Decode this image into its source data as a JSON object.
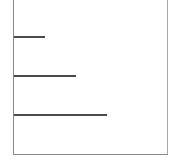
{
  "diagram": {
    "frame": {
      "left": 13,
      "top": 0,
      "width": 155,
      "height": 155,
      "open_side": "top",
      "border_color": "#8a8a8a"
    },
    "lines": [
      {
        "y": 36,
        "x_start": 14,
        "x_end": 45,
        "color": "#4a4a4a"
      },
      {
        "y": 75,
        "x_start": 14,
        "x_end": 76,
        "color": "#4a4a4a"
      },
      {
        "y": 114,
        "x_start": 14,
        "x_end": 107,
        "color": "#4a4a4a"
      }
    ]
  }
}
